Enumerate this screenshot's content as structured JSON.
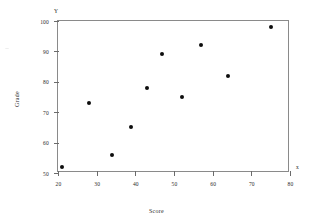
{
  "chart_data": {
    "type": "scatter",
    "title": "",
    "xlabel": "Score",
    "ylabel": "Grade",
    "xlim": [
      20,
      80
    ],
    "ylim": [
      50,
      100
    ],
    "grid": false,
    "legend": null,
    "x_ticks": [
      "20",
      "30",
      "40",
      "50",
      "60",
      "70",
      "80"
    ],
    "y_ticks": [
      "50",
      "60",
      "70",
      "80",
      "90",
      "100"
    ],
    "axis_caps": {
      "y": "Y",
      "x": "x"
    },
    "series": [
      {
        "name": "Score vs Grade",
        "marker": "filled-circle",
        "color": "#0d0d0d",
        "points": [
          {
            "x": 21,
            "y": 52
          },
          {
            "x": 28,
            "y": 73
          },
          {
            "x": 34,
            "y": 56
          },
          {
            "x": 39,
            "y": 65
          },
          {
            "x": 43,
            "y": 78
          },
          {
            "x": 47,
            "y": 89
          },
          {
            "x": 52,
            "y": 75
          },
          {
            "x": 57,
            "y": 92
          },
          {
            "x": 64,
            "y": 82
          },
          {
            "x": 75,
            "y": 98
          }
        ]
      }
    ]
  }
}
